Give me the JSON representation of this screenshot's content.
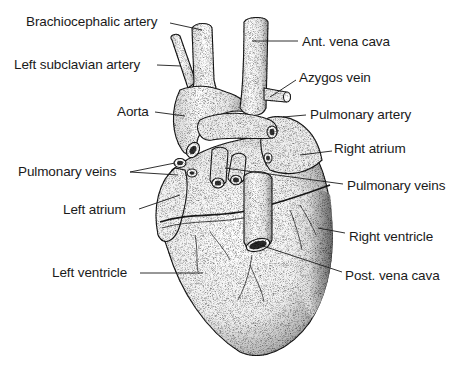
{
  "diagram": {
    "colors": {
      "ink": "#1a1a1a",
      "background": "#ffffff",
      "stipple": "#444444"
    },
    "labels": [
      {
        "id": "brachiocephalic-artery",
        "text": "Brachiocephalic artery",
        "x": 26,
        "y": 14
      },
      {
        "id": "left-subclavian-artery",
        "text": "Left subclavian artery",
        "x": 14,
        "y": 57
      },
      {
        "id": "aorta",
        "text": "Aorta",
        "x": 117,
        "y": 104
      },
      {
        "id": "ant-vena-cava",
        "text": "Ant. vena cava",
        "x": 302,
        "y": 34
      },
      {
        "id": "azygos-vein",
        "text": "Azygos vein",
        "x": 299,
        "y": 70
      },
      {
        "id": "pulmonary-artery",
        "text": "Pulmonary artery",
        "x": 310,
        "y": 107
      },
      {
        "id": "right-atrium",
        "text": "Right atrium",
        "x": 334,
        "y": 141
      },
      {
        "id": "pulmonary-veins-left",
        "text": "Pulmonary veins",
        "x": 18,
        "y": 164
      },
      {
        "id": "pulmonary-veins-right",
        "text": "Pulmonary veins",
        "x": 347,
        "y": 178
      },
      {
        "id": "left-atrium",
        "text": "Left atrium",
        "x": 63,
        "y": 202
      },
      {
        "id": "right-ventricle",
        "text": "Right ventricle",
        "x": 349,
        "y": 229
      },
      {
        "id": "left-ventricle",
        "text": "Left ventricle",
        "x": 52,
        "y": 265
      },
      {
        "id": "post-vena-cava",
        "text": "Post. vena cava",
        "x": 345,
        "y": 268
      }
    ]
  }
}
